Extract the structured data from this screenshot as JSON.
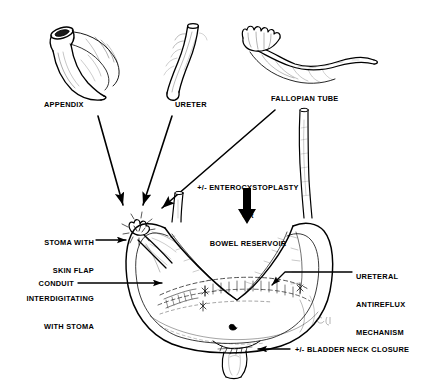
{
  "figure": {
    "type": "medical-illustration",
    "background_color": "#ffffff",
    "ink_color": "#000000",
    "signature": "RC"
  },
  "donor_structures": [
    {
      "id": "appendix",
      "label": "APPENDIX"
    },
    {
      "id": "ureter",
      "label": "URETER"
    },
    {
      "id": "fallopian-tube",
      "label": "FALLOPIAN TUBE"
    }
  ],
  "annotations": {
    "augmentation": {
      "lines": [
        "+/- ENTEROCYSTOPLASTY",
        "OR",
        "BOWEL RESERVOIR"
      ]
    },
    "stoma": {
      "lines": [
        "STOMA WITH",
        "SKIN FLAP",
        "INTERDIGITATING",
        "WITH STOMA"
      ]
    },
    "conduit": {
      "label": "CONDUIT"
    },
    "antireflux": {
      "lines": [
        "URETERAL",
        "ANTIREFLUX",
        "MECHANISM"
      ]
    },
    "bladder_neck": {
      "label": "+/- BLADDER NECK CLOSURE"
    }
  },
  "arrows": {
    "appendix_to_conduit": "arrow",
    "ureter_to_conduit": "arrow",
    "fallopian_to_conduit": "arrow",
    "augmentation_down": "arrow-down",
    "stoma_pointer": "arrow-right",
    "conduit_pointer": "arrow-right",
    "antireflux_pointer": "arrow-left",
    "bladder_neck_pointer": "arrow-left"
  }
}
